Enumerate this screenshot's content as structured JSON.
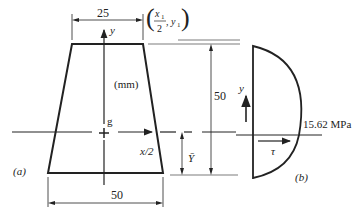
{
  "figure_a": {
    "label": "(a)",
    "units": "(mm)",
    "top_width": "25",
    "bottom_width": "50",
    "height": "50",
    "centroid_label": "g",
    "y_axis_label": "y",
    "x_axis_label": "x/2",
    "ybar_label": "Ȳ",
    "point_label_x": "x",
    "point_label_x_sub": "1",
    "point_label_den": "2",
    "point_label_y": "y",
    "point_label_y_sub": "1"
  },
  "figure_b": {
    "label": "(b)",
    "y_axis_label": "y",
    "tau_label": "τ",
    "max_stress": "15.62 MPa"
  },
  "colors": {
    "ink": "#222222",
    "background": "#ffffff"
  }
}
